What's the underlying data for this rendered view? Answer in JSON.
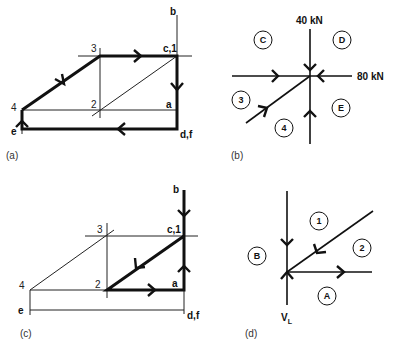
{
  "panels": {
    "a": {
      "caption": "(a)",
      "labels": {
        "b": "b",
        "c1": "c,1",
        "three": "3",
        "two": "2",
        "four": "4",
        "a": "a",
        "e": "e",
        "df": "d,f"
      }
    },
    "b": {
      "caption": "(b)",
      "loads": {
        "vertical": "40 kN",
        "horizontal": "80 kN"
      },
      "regions": {
        "C": "C",
        "D": "D",
        "three": "3",
        "E": "E",
        "four": "4"
      }
    },
    "c": {
      "caption": "(c)",
      "labels": {
        "b": "b",
        "c1": "c,1",
        "three": "3",
        "two": "2",
        "four": "4",
        "a": "a",
        "e": "e",
        "df": "d,f"
      }
    },
    "d": {
      "caption": "(d)",
      "regions": {
        "one": "1",
        "two": "2",
        "B": "B",
        "A": "A"
      },
      "reaction": {
        "main": "V",
        "sub": "L"
      }
    }
  }
}
